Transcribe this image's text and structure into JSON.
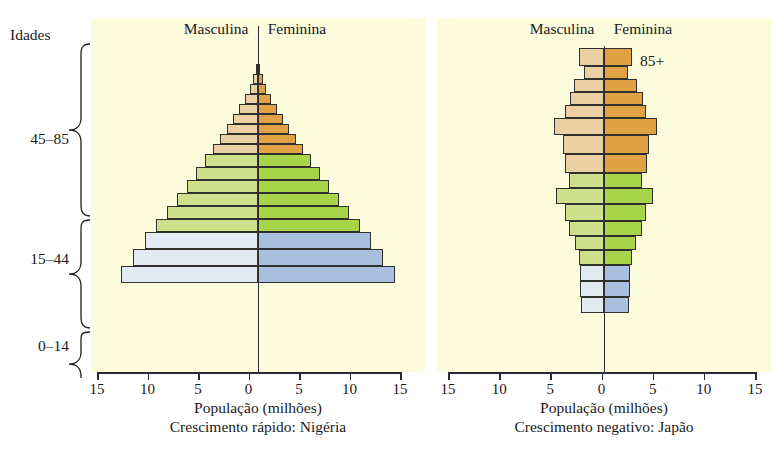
{
  "axis_label_left": "Idades",
  "note_85plus": "85+",
  "age_groups": [
    {
      "label": "45–85",
      "top": 46,
      "bottom": 212
    },
    {
      "label": "15–44",
      "top": 212,
      "bottom": 310
    },
    {
      "label": "0–14",
      "top": 310,
      "bottom": 372
    }
  ],
  "charts": [
    {
      "id": "nigeria",
      "head_male": "Masculina",
      "head_female": "Feminina",
      "xlabel": "População (milhões)",
      "caption": "Crescimento rápido: Nigéria",
      "ticks": [
        "15",
        "10",
        "5",
        "0",
        "5",
        "10",
        "15"
      ]
    },
    {
      "id": "japao",
      "head_male": "Masculina",
      "head_female": "Feminina",
      "xlabel": "População (milhões)",
      "caption": "Crescimento negativo: Japão",
      "ticks": [
        "15",
        "10",
        "5",
        "0",
        "5",
        "10",
        "15"
      ]
    }
  ],
  "colors": {
    "panel": "#fcfbdc",
    "male_blue": "#e2eaf4",
    "female_blue": "#a8bfdd",
    "male_green": "#cfe08a",
    "female_green": "#a8d44a",
    "male_tan": "#ead0a2",
    "female_orange": "#e0a244",
    "outline": "#30302e"
  },
  "chart_data": [
    {
      "type": "bar",
      "subtype": "population-pyramid",
      "title": "Crescimento rápido: Nigéria",
      "xlabel": "População (milhões)",
      "ylabel": "Idades",
      "xlim": [
        -15,
        15
      ],
      "xticks": [
        15,
        10,
        5,
        0,
        5,
        10,
        15
      ],
      "grid": false,
      "legend": [
        "Masculina",
        "Feminina"
      ],
      "categories": [
        "0–4",
        "5–9",
        "10–14",
        "15–19",
        "20–24",
        "25–29",
        "30–34",
        "35–39",
        "40–44",
        "45–49",
        "50–54",
        "55–59",
        "60–64",
        "65–69",
        "70–74",
        "75–79",
        "80–84",
        "85+"
      ],
      "series": [
        {
          "name": "Masculina",
          "values": [
            13.4,
            11.4,
            9.6,
            8.1,
            6.8,
            5.7,
            4.8,
            4.0,
            3.3,
            2.7,
            2.2,
            1.7,
            1.3,
            1.0,
            0.7,
            0.45,
            0.25,
            0.1
          ]
        },
        {
          "name": "Feminina",
          "values": [
            13.4,
            11.4,
            9.6,
            8.1,
            6.8,
            5.7,
            4.8,
            4.0,
            3.3,
            2.7,
            2.2,
            1.7,
            1.3,
            1.0,
            0.7,
            0.45,
            0.25,
            0.1
          ]
        }
      ],
      "color_bands": [
        {
          "range": "0–14",
          "male": "#e2eaf4",
          "female": "#a8bfdd"
        },
        {
          "range": "15–44",
          "male": "#cfe08a",
          "female": "#a8d44a"
        },
        {
          "range": "45–85",
          "male": "#ead0a2",
          "female": "#e0a244"
        }
      ]
    },
    {
      "type": "bar",
      "subtype": "population-pyramid",
      "title": "Crescimento negativo: Japão",
      "xlabel": "População (milhões)",
      "ylabel": "Idades",
      "xlim": [
        -15,
        15
      ],
      "xticks": [
        15,
        10,
        5,
        0,
        5,
        10,
        15
      ],
      "grid": false,
      "legend": [
        "Masculina",
        "Feminina"
      ],
      "annotations": [
        {
          "text": "85+",
          "at": "top-right"
        }
      ],
      "categories": [
        "0–4",
        "5–9",
        "10–14",
        "15–19",
        "20–24",
        "25–29",
        "30–34",
        "35–39",
        "40–44",
        "45–49",
        "50–54",
        "55–59",
        "60–64",
        "65–69",
        "70–74",
        "75–79",
        "80–84",
        "85+"
      ],
      "series": [
        {
          "name": "Masculina",
          "values": [
            2.6,
            2.7,
            2.8,
            3.0,
            3.2,
            3.6,
            4.0,
            4.6,
            5.2,
            4.2,
            4.4,
            4.6,
            5.4,
            4.4,
            4.0,
            3.6,
            3.0,
            2.4
          ]
        },
        {
          "name": "Feminina",
          "values": [
            2.5,
            2.6,
            2.7,
            2.9,
            3.1,
            3.5,
            3.9,
            4.5,
            5.1,
            4.1,
            4.3,
            4.5,
            5.3,
            4.3,
            3.9,
            3.5,
            2.9,
            2.3
          ]
        },
        {
          "name": "Masculina_rows",
          "values": []
        }
      ],
      "color_bands": [
        {
          "range": "0–14",
          "male": "#e2eaf4",
          "female": "#a8bfdd"
        },
        {
          "range": "15–44",
          "male": "#cfe08a",
          "female": "#a8d44a"
        },
        {
          "range": "45–85",
          "male": "#ead0a2",
          "female": "#e0a244"
        }
      ]
    }
  ],
  "bar_rows": {
    "nigeria": [
      {
        "m": 0.15,
        "f": 0.15,
        "mc": "#ead0a2",
        "fc": "#e0a244",
        "h": 10
      },
      {
        "m": 0.45,
        "f": 0.45,
        "mc": "#ead0a2",
        "fc": "#e0a244",
        "h": 10
      },
      {
        "m": 0.8,
        "f": 0.8,
        "mc": "#ead0a2",
        "fc": "#e0a244",
        "h": 10
      },
      {
        "m": 1.3,
        "f": 1.3,
        "mc": "#ead0a2",
        "fc": "#e0a244",
        "h": 10
      },
      {
        "m": 1.9,
        "f": 1.9,
        "mc": "#ead0a2",
        "fc": "#e0a244",
        "h": 10
      },
      {
        "m": 2.5,
        "f": 2.5,
        "mc": "#ead0a2",
        "fc": "#e0a244",
        "h": 10
      },
      {
        "m": 3.1,
        "f": 3.1,
        "mc": "#ead0a2",
        "fc": "#e0a244",
        "h": 10
      },
      {
        "m": 3.8,
        "f": 3.8,
        "mc": "#ead0a2",
        "fc": "#e0a244",
        "h": 10
      },
      {
        "m": 4.5,
        "f": 4.5,
        "mc": "#ead0a2",
        "fc": "#e0a244",
        "h": 10
      },
      {
        "m": 5.2,
        "f": 5.2,
        "mc": "#cfe08a",
        "fc": "#a8d44a",
        "h": 13
      },
      {
        "m": 6.1,
        "f": 6.1,
        "mc": "#cfe08a",
        "fc": "#a8d44a",
        "h": 13
      },
      {
        "m": 7.0,
        "f": 7.0,
        "mc": "#cfe08a",
        "fc": "#a8d44a",
        "h": 13
      },
      {
        "m": 8.0,
        "f": 8.0,
        "mc": "#cfe08a",
        "fc": "#a8d44a",
        "h": 13
      },
      {
        "m": 9.0,
        "f": 9.0,
        "mc": "#cfe08a",
        "fc": "#a8d44a",
        "h": 13
      },
      {
        "m": 10.1,
        "f": 10.1,
        "mc": "#cfe08a",
        "fc": "#a8d44a",
        "h": 13
      },
      {
        "m": 11.2,
        "f": 11.2,
        "mc": "#e2eaf4",
        "fc": "#a8bfdd",
        "h": 17
      },
      {
        "m": 12.4,
        "f": 12.4,
        "mc": "#e2eaf4",
        "fc": "#a8bfdd",
        "h": 17
      },
      {
        "m": 13.6,
        "f": 13.6,
        "mc": "#e2eaf4",
        "fc": "#a8bfdd",
        "h": 17
      }
    ],
    "japao": [
      {
        "m": 2.5,
        "f": 2.8,
        "mc": "#ead0a2",
        "fc": "#e0a244",
        "h": 18
      },
      {
        "m": 2.0,
        "f": 2.4,
        "mc": "#ead0a2",
        "fc": "#e0a244",
        "h": 13
      },
      {
        "m": 3.0,
        "f": 3.3,
        "mc": "#ead0a2",
        "fc": "#e0a244",
        "h": 13
      },
      {
        "m": 3.4,
        "f": 3.9,
        "mc": "#ead0a2",
        "fc": "#e0a244",
        "h": 13
      },
      {
        "m": 3.9,
        "f": 4.2,
        "mc": "#ead0a2",
        "fc": "#e0a244",
        "h": 13
      },
      {
        "m": 5.0,
        "f": 5.2,
        "mc": "#ead0a2",
        "fc": "#e0a244",
        "h": 17
      },
      {
        "m": 4.1,
        "f": 4.5,
        "mc": "#ead0a2",
        "fc": "#e0a244",
        "h": 19
      },
      {
        "m": 3.9,
        "f": 4.3,
        "mc": "#ead0a2",
        "fc": "#e0a244",
        "h": 19
      },
      {
        "m": 3.5,
        "f": 3.8,
        "mc": "#cfe08a",
        "fc": "#a8d44a",
        "h": 15
      },
      {
        "m": 4.8,
        "f": 4.9,
        "mc": "#cfe08a",
        "fc": "#a8d44a",
        "h": 16
      },
      {
        "m": 3.9,
        "f": 4.2,
        "mc": "#cfe08a",
        "fc": "#a8d44a",
        "h": 17
      },
      {
        "m": 3.5,
        "f": 3.8,
        "mc": "#cfe08a",
        "fc": "#a8d44a",
        "h": 15
      },
      {
        "m": 2.9,
        "f": 3.2,
        "mc": "#cfe08a",
        "fc": "#a8d44a",
        "h": 14
      },
      {
        "m": 2.5,
        "f": 2.8,
        "mc": "#cfe08a",
        "fc": "#a8d44a",
        "h": 15
      },
      {
        "m": 2.4,
        "f": 2.6,
        "mc": "#e2eaf4",
        "fc": "#a8bfdd",
        "h": 16
      },
      {
        "m": 2.4,
        "f": 2.6,
        "mc": "#e2eaf4",
        "fc": "#a8bfdd",
        "h": 16
      },
      {
        "m": 2.3,
        "f": 2.5,
        "mc": "#e2eaf4",
        "fc": "#a8bfdd",
        "h": 16
      }
    ]
  }
}
